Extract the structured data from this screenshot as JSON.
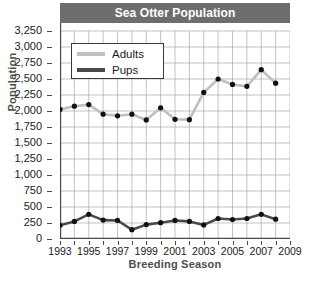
{
  "chart_data": {
    "type": "line",
    "title": "Sea Otter Population",
    "xlabel": "Breeding Season",
    "ylabel": "Population",
    "x": [
      1993,
      1994,
      1995,
      1996,
      1997,
      1998,
      1999,
      2000,
      2001,
      2002,
      2003,
      2004,
      2005,
      2006,
      2007,
      2008
    ],
    "series": [
      {
        "name": "Adults",
        "color": "#bfbfbf",
        "marker_color": "#111111",
        "values": [
          2025,
          2075,
          2100,
          1950,
          1925,
          1950,
          1860,
          2050,
          1870,
          1865,
          2290,
          2500,
          2415,
          2385,
          2645,
          2435
        ]
      },
      {
        "name": "Pups",
        "color": "#4a4a4a",
        "marker_color": "#111111",
        "values": [
          215,
          275,
          385,
          295,
          290,
          145,
          225,
          255,
          290,
          275,
          220,
          320,
          305,
          320,
          385,
          310
        ]
      }
    ],
    "ylim": [
      0,
      3250
    ],
    "yticks": [
      0,
      250,
      500,
      750,
      1000,
      1250,
      1500,
      1750,
      2000,
      2250,
      2500,
      2750,
      3000,
      3250
    ],
    "ytick_labels": [
      "0",
      "250",
      "500",
      "750",
      "1,000",
      "1,250",
      "1,500",
      "1,750",
      "2,000",
      "2,250",
      "2,500",
      "2,750",
      "3,000",
      "3,250"
    ],
    "xlim": [
      1993,
      2009
    ],
    "xticks": [
      1993,
      1994,
      1995,
      1996,
      1997,
      1998,
      1999,
      2000,
      2001,
      2002,
      2003,
      2004,
      2005,
      2006,
      2007,
      2008,
      2009
    ],
    "xtick_labels_shown": [
      "1993",
      "1995",
      "1997",
      "1999",
      "2001",
      "2003",
      "2005",
      "2007",
      "2009"
    ],
    "grid": true,
    "grid_color": "#9a9a9a",
    "legend_position": "upper-left",
    "title_bar_color": "#6d6d6d",
    "title_text_color": "#ffffff"
  }
}
